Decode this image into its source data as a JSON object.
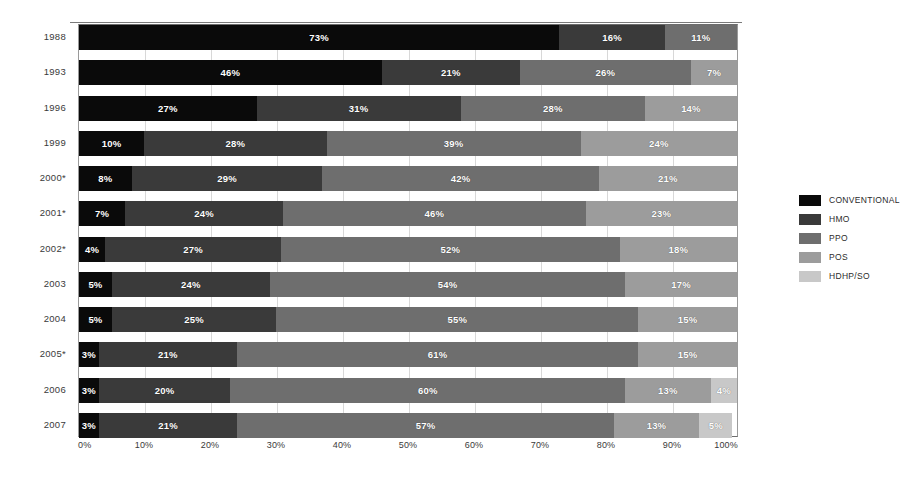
{
  "chart_data": {
    "type": "bar",
    "orientation": "horizontal-stacked",
    "title": "",
    "xlabel": "",
    "ylabel": "",
    "xlim": [
      0,
      100
    ],
    "grid": true,
    "legend_position": "right",
    "categories": [
      "1988",
      "1993",
      "1996",
      "1999",
      "2000*",
      "2001*",
      "2002*",
      "2003",
      "2004",
      "2005*",
      "2006",
      "2007"
    ],
    "series": [
      {
        "name": "CONVENTIONAL",
        "color": "#0a0a0a",
        "values": [
          73,
          46,
          27,
          10,
          8,
          7,
          4,
          5,
          5,
          3,
          3,
          3
        ]
      },
      {
        "name": "HMO",
        "color": "#3a3a3a",
        "values": [
          16,
          21,
          31,
          28,
          29,
          24,
          27,
          24,
          25,
          21,
          20,
          21
        ]
      },
      {
        "name": "PPO",
        "color": "#6e6e6e",
        "values": [
          11,
          26,
          28,
          39,
          42,
          46,
          52,
          54,
          55,
          61,
          60,
          57
        ]
      },
      {
        "name": "POS",
        "color": "#9c9c9c",
        "values": [
          0,
          7,
          14,
          24,
          21,
          23,
          18,
          17,
          15,
          15,
          13,
          13
        ]
      },
      {
        "name": "HDHP/SO",
        "color": "#c8c8c8",
        "values": [
          0,
          0,
          0,
          0,
          0,
          0,
          0,
          0,
          0,
          0,
          4,
          5
        ]
      }
    ],
    "x_ticks": [
      "0%",
      "10%",
      "20%",
      "30%",
      "40%",
      "50%",
      "60%",
      "70%",
      "80%",
      "90%",
      "100%"
    ],
    "x_tick_values": [
      0,
      10,
      20,
      30,
      40,
      50,
      60,
      70,
      80,
      90,
      100
    ],
    "rows": [
      {
        "year": "1988",
        "segments": [
          {
            "series": "CONVENTIONAL",
            "value": 73,
            "label": "73%",
            "color": "#0a0a0a"
          },
          {
            "series": "HMO",
            "value": 16,
            "label": "16%",
            "color": "#3a3a3a"
          },
          {
            "series": "PPO",
            "value": 11,
            "label": "11%",
            "color": "#6e6e6e"
          }
        ]
      },
      {
        "year": "1993",
        "segments": [
          {
            "series": "CONVENTIONAL",
            "value": 46,
            "label": "46%",
            "color": "#0a0a0a"
          },
          {
            "series": "HMO",
            "value": 21,
            "label": "21%",
            "color": "#3a3a3a"
          },
          {
            "series": "PPO",
            "value": 26,
            "label": "26%",
            "color": "#6e6e6e"
          },
          {
            "series": "POS",
            "value": 7,
            "label": "7%",
            "color": "#9c9c9c"
          }
        ]
      },
      {
        "year": "1996",
        "segments": [
          {
            "series": "CONVENTIONAL",
            "value": 27,
            "label": "27%",
            "color": "#0a0a0a"
          },
          {
            "series": "HMO",
            "value": 31,
            "label": "31%",
            "color": "#3a3a3a"
          },
          {
            "series": "PPO",
            "value": 28,
            "label": "28%",
            "color": "#6e6e6e"
          },
          {
            "series": "POS",
            "value": 14,
            "label": "14%",
            "color": "#9c9c9c"
          }
        ]
      },
      {
        "year": "1999",
        "segments": [
          {
            "series": "CONVENTIONAL",
            "value": 10,
            "label": "10%",
            "color": "#0a0a0a"
          },
          {
            "series": "HMO",
            "value": 28,
            "label": "28%",
            "color": "#3a3a3a"
          },
          {
            "series": "PPO",
            "value": 39,
            "label": "39%",
            "color": "#6e6e6e"
          },
          {
            "series": "POS",
            "value": 24,
            "label": "24%",
            "color": "#9c9c9c"
          }
        ]
      },
      {
        "year": "2000*",
        "segments": [
          {
            "series": "CONVENTIONAL",
            "value": 8,
            "label": "8%",
            "color": "#0a0a0a"
          },
          {
            "series": "HMO",
            "value": 29,
            "label": "29%",
            "color": "#3a3a3a"
          },
          {
            "series": "PPO",
            "value": 42,
            "label": "42%",
            "color": "#6e6e6e"
          },
          {
            "series": "POS",
            "value": 21,
            "label": "21%",
            "color": "#9c9c9c"
          }
        ]
      },
      {
        "year": "2001*",
        "segments": [
          {
            "series": "CONVENTIONAL",
            "value": 7,
            "label": "7%",
            "color": "#0a0a0a"
          },
          {
            "series": "HMO",
            "value": 24,
            "label": "24%",
            "color": "#3a3a3a"
          },
          {
            "series": "PPO",
            "value": 46,
            "label": "46%",
            "color": "#6e6e6e"
          },
          {
            "series": "POS",
            "value": 23,
            "label": "23%",
            "color": "#9c9c9c"
          }
        ]
      },
      {
        "year": "2002*",
        "segments": [
          {
            "series": "CONVENTIONAL",
            "value": 4,
            "label": "4%",
            "color": "#0a0a0a"
          },
          {
            "series": "HMO",
            "value": 27,
            "label": "27%",
            "color": "#3a3a3a"
          },
          {
            "series": "PPO",
            "value": 52,
            "label": "52%",
            "color": "#6e6e6e"
          },
          {
            "series": "POS",
            "value": 18,
            "label": "18%",
            "color": "#9c9c9c"
          }
        ]
      },
      {
        "year": "2003",
        "segments": [
          {
            "series": "CONVENTIONAL",
            "value": 5,
            "label": "5%",
            "color": "#0a0a0a"
          },
          {
            "series": "HMO",
            "value": 24,
            "label": "24%",
            "color": "#3a3a3a"
          },
          {
            "series": "PPO",
            "value": 54,
            "label": "54%",
            "color": "#6e6e6e"
          },
          {
            "series": "POS",
            "value": 17,
            "label": "17%",
            "color": "#9c9c9c"
          }
        ]
      },
      {
        "year": "2004",
        "segments": [
          {
            "series": "CONVENTIONAL",
            "value": 5,
            "label": "5%",
            "color": "#0a0a0a"
          },
          {
            "series": "HMO",
            "value": 25,
            "label": "25%",
            "color": "#3a3a3a"
          },
          {
            "series": "PPO",
            "value": 55,
            "label": "55%",
            "color": "#6e6e6e"
          },
          {
            "series": "POS",
            "value": 15,
            "label": "15%",
            "color": "#9c9c9c"
          }
        ]
      },
      {
        "year": "2005*",
        "segments": [
          {
            "series": "CONVENTIONAL",
            "value": 3,
            "label": "3%",
            "color": "#0a0a0a"
          },
          {
            "series": "HMO",
            "value": 21,
            "label": "21%",
            "color": "#3a3a3a"
          },
          {
            "series": "PPO",
            "value": 61,
            "label": "61%",
            "color": "#6e6e6e"
          },
          {
            "series": "POS",
            "value": 15,
            "label": "15%",
            "color": "#9c9c9c"
          }
        ]
      },
      {
        "year": "2006",
        "segments": [
          {
            "series": "CONVENTIONAL",
            "value": 3,
            "label": "3%",
            "color": "#0a0a0a"
          },
          {
            "series": "HMO",
            "value": 20,
            "label": "20%",
            "color": "#3a3a3a"
          },
          {
            "series": "PPO",
            "value": 60,
            "label": "60%",
            "color": "#6e6e6e"
          },
          {
            "series": "POS",
            "value": 13,
            "label": "13%",
            "color": "#9c9c9c"
          },
          {
            "series": "HDHP/SO",
            "value": 4,
            "label": "4%",
            "color": "#c8c8c8"
          }
        ]
      },
      {
        "year": "2007",
        "segments": [
          {
            "series": "CONVENTIONAL",
            "value": 3,
            "label": "3%",
            "color": "#0a0a0a"
          },
          {
            "series": "HMO",
            "value": 21,
            "label": "21%",
            "color": "#3a3a3a"
          },
          {
            "series": "PPO",
            "value": 57,
            "label": "57%",
            "color": "#6e6e6e"
          },
          {
            "series": "POS",
            "value": 13,
            "label": "13%",
            "color": "#9c9c9c"
          },
          {
            "series": "HDHP/SO",
            "value": 5,
            "label": "5%",
            "color": "#c8c8c8"
          }
        ]
      }
    ],
    "legend": [
      {
        "label": "CONVENTIONAL",
        "color": "#0a0a0a"
      },
      {
        "label": "HMO",
        "color": "#3a3a3a"
      },
      {
        "label": "PPO",
        "color": "#6e6e6e"
      },
      {
        "label": "POS",
        "color": "#9c9c9c"
      },
      {
        "label": "HDHP/SO",
        "color": "#c8c8c8"
      }
    ]
  }
}
